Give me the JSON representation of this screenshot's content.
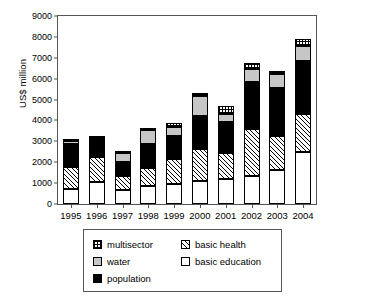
{
  "chart_data": {
    "type": "bar",
    "subtype": "stacked",
    "title": "",
    "xlabel": "",
    "ylabel": "US$ million",
    "ylim": [
      0,
      9000
    ],
    "ytick_step": 1000,
    "yticks": [
      "0",
      "1000",
      "2000",
      "3000",
      "4000",
      "5000",
      "6000",
      "7000",
      "8000",
      "9000"
    ],
    "grid": false,
    "legend_position": "bottom",
    "categories": [
      "1995",
      "1996",
      "1997",
      "1998",
      "1999",
      "2000",
      "2001",
      "2002",
      "2003",
      "2004"
    ],
    "series": [
      {
        "name": "basic education",
        "pattern": "solid-white",
        "values": [
          700,
          1050,
          680,
          880,
          950,
          1120,
          1200,
          1330,
          1630,
          2480
        ]
      },
      {
        "name": "basic health",
        "pattern": "diagonal-hatch",
        "values": [
          1080,
          1200,
          670,
          840,
          1190,
          1530,
          1260,
          2240,
          1620,
          1840
        ]
      },
      {
        "name": "population",
        "pattern": "solid-black",
        "values": [
          1080,
          850,
          640,
          1150,
          1100,
          1550,
          1480,
          2260,
          2320,
          2540
        ]
      },
      {
        "name": "water",
        "pattern": "solid-gray",
        "values": [
          180,
          60,
          460,
          690,
          450,
          950,
          390,
          620,
          640,
          700
        ]
      },
      {
        "name": "multisector",
        "pattern": "grid-hatch",
        "values": [
          80,
          80,
          50,
          100,
          170,
          160,
          360,
          310,
          180,
          340
        ]
      }
    ],
    "totals": [
      3120,
      3240,
      2500,
      3660,
      3860,
      5310,
      4690,
      6760,
      6390,
      7900
    ]
  },
  "legend": {
    "entries": [
      {
        "label": "multisector",
        "key": "multisector"
      },
      {
        "label": "basic health",
        "key": "basic-health"
      },
      {
        "label": "water",
        "key": "water"
      },
      {
        "label": "basic education",
        "key": "basic-education"
      },
      {
        "label": "population",
        "key": "population"
      }
    ]
  },
  "colors": {
    "population": "#000000",
    "water": "#c6c6c6",
    "basic_education": "#ffffff",
    "axis": "#555555"
  }
}
